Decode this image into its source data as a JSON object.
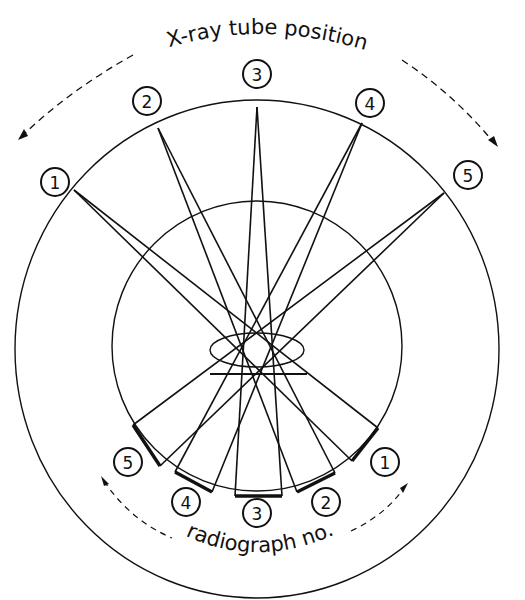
{
  "diagram": {
    "top_label": "X-ray tube position",
    "bottom_label": "radiograph no.",
    "colors": {
      "ink": "#111111",
      "background": "#ffffff"
    },
    "outer_circle": {
      "cx": 257,
      "cy": 349,
      "rx": 242,
      "ry": 249
    },
    "inner_circle": {
      "cx": 257,
      "cy": 346,
      "r": 145
    },
    "object": {
      "ellipse": {
        "cx": 257,
        "cy": 350,
        "rx": 47,
        "ry": 17
      },
      "bar": {
        "x1": 210,
        "x2": 307,
        "y": 374
      }
    },
    "tube_positions": [
      {
        "label": "1",
        "source": [
          74,
          190
        ],
        "label_pos": [
          55,
          182
        ]
      },
      {
        "label": "2",
        "source": [
          158,
          128
        ],
        "label_pos": [
          147,
          101
        ]
      },
      {
        "label": "3",
        "source": [
          257,
          107
        ],
        "label_pos": [
          257,
          74
        ]
      },
      {
        "label": "4",
        "source": [
          362,
          123
        ],
        "label_pos": [
          370,
          103
        ]
      },
      {
        "label": "5",
        "source": [
          444,
          193
        ],
        "label_pos": [
          468,
          175
        ]
      }
    ],
    "radiographs": [
      {
        "label": "1",
        "film": [
          [
            378,
            428
          ],
          [
            352,
            461
          ]
        ],
        "label_pos": [
          385,
          462
        ]
      },
      {
        "label": "2",
        "film": [
          [
            335,
            473
          ],
          [
            297,
            492
          ]
        ],
        "label_pos": [
          326,
          502
        ]
      },
      {
        "label": "3",
        "film": [
          [
            282,
            496
          ],
          [
            235,
            496
          ]
        ],
        "label_pos": [
          257,
          513
        ]
      },
      {
        "label": "4",
        "film": [
          [
            212,
            492
          ],
          [
            175,
            472
          ]
        ],
        "label_pos": [
          186,
          502
        ]
      },
      {
        "label": "5",
        "film": [
          [
            160,
            466
          ],
          [
            133,
            425
          ]
        ],
        "label_pos": [
          128,
          462
        ]
      }
    ]
  }
}
